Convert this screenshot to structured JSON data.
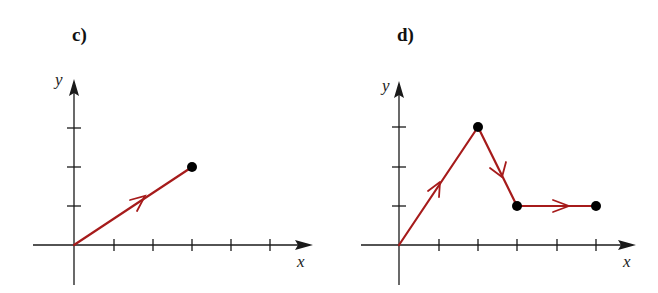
{
  "colors": {
    "path": "#a61b1b",
    "axis": "#1a1a1a",
    "point": "#000000"
  },
  "panels": [
    {
      "label": "c)",
      "x_axis_label": "x",
      "y_axis_label": "y",
      "x_ticks": 5,
      "y_ticks": 3,
      "points": [
        [
          0,
          0
        ],
        [
          3,
          2
        ]
      ],
      "marked_points": [
        [
          3,
          2
        ]
      ]
    },
    {
      "label": "d)",
      "x_axis_label": "x",
      "y_axis_label": "y",
      "x_ticks": 5,
      "y_ticks": 3,
      "points": [
        [
          0,
          0
        ],
        [
          2,
          3
        ],
        [
          3,
          1
        ],
        [
          5,
          1
        ]
      ],
      "marked_points": [
        [
          2,
          3
        ],
        [
          3,
          1
        ],
        [
          5,
          1
        ]
      ]
    }
  ]
}
